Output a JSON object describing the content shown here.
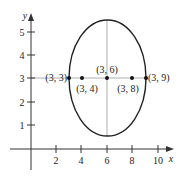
{
  "diagram": {
    "type": "ellipse-plot",
    "axes": {
      "x_label": "x",
      "y_label": "y",
      "x_ticks": [
        "2",
        "4",
        "6",
        "8",
        "10"
      ],
      "y_ticks": [
        "1",
        "2",
        "3",
        "4",
        "5"
      ]
    },
    "ellipse": {
      "center": "(3, 6)",
      "vertical_axis_line": true,
      "horizontal_axis_line": true
    },
    "points": [
      {
        "label": "(3, 3)"
      },
      {
        "label": "(3, 4)"
      },
      {
        "label": "(3, 6)"
      },
      {
        "label": "(3, 8)"
      },
      {
        "label": "(3, 9)"
      }
    ],
    "colors": {
      "curve": "#222222",
      "axis": "#333333",
      "guide": "#999999"
    }
  }
}
